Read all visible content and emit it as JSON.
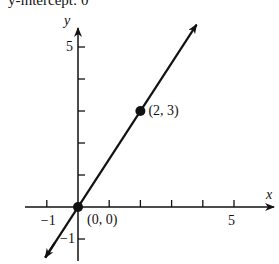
{
  "caption": "y-intercept: 0",
  "chart_data": {
    "type": "line",
    "title": "",
    "xlabel": "x",
    "ylabel": "y",
    "xlim": [
      -1.6,
      6.2
    ],
    "ylim": [
      -1.7,
      5.8
    ],
    "x_ticks": [
      -1,
      0,
      1,
      2,
      3,
      4,
      5
    ],
    "y_ticks": [
      -1,
      1,
      2,
      3,
      4,
      5
    ],
    "x_tick_labels": [
      {
        "value": -1,
        "label": "−1"
      },
      {
        "value": 5,
        "label": "5"
      }
    ],
    "y_tick_labels": [
      {
        "value": 5,
        "label": "5"
      },
      {
        "value": -1,
        "label": "−1"
      }
    ],
    "grid": false,
    "series": [
      {
        "name": "y = 1.5x",
        "slope": 1.5,
        "intercept": 0,
        "x": [
          -1.05,
          3.8
        ],
        "y": [
          -1.58,
          5.7
        ],
        "arrows": "both"
      }
    ],
    "points": [
      {
        "x": 0,
        "y": 0,
        "label": "(0, 0)"
      },
      {
        "x": 2,
        "y": 3,
        "label": "(2, 3)"
      }
    ]
  },
  "colors": {
    "ink": "#111111",
    "background": "#ffffff"
  }
}
